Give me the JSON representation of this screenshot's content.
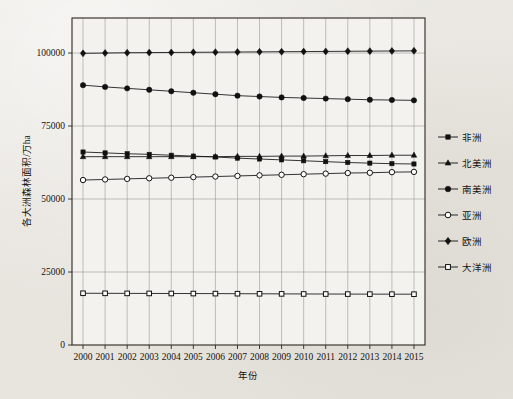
{
  "chart_data": {
    "type": "line",
    "title": "",
    "subtitle": "",
    "xlabel": "年份",
    "ylabel": "各大洲森林面积/万ha",
    "x": [
      2000,
      2001,
      2002,
      2003,
      2004,
      2005,
      2006,
      2007,
      2008,
      2009,
      2010,
      2011,
      2012,
      2013,
      2014,
      2015
    ],
    "xtick_labels": [
      "2000",
      "2001",
      "2002",
      "2003",
      "2004",
      "2005",
      "2006",
      "2007",
      "2008",
      "2009",
      "2010",
      "2011",
      "2012",
      "2013",
      "2014",
      "2015"
    ],
    "ytick_labels": [
      "0",
      "25000",
      "50000",
      "75000",
      "100000"
    ],
    "ytick_values": [
      0,
      25000,
      50000,
      75000,
      100000
    ],
    "xlim": [
      1999.5,
      2015.5
    ],
    "ylim": [
      0,
      112000
    ],
    "grid": "vertical-at-each-year-and-horizontal-at-major-ticks",
    "legend_position": "right",
    "series": [
      {
        "name": "非洲",
        "marker": "filled-square",
        "color": "#111111",
        "values": [
          66100,
          65800,
          65500,
          65300,
          65000,
          64700,
          64400,
          64000,
          63700,
          63400,
          63100,
          62800,
          62500,
          62300,
          62100,
          62000
        ]
      },
      {
        "name": "北美洲",
        "marker": "filled-triangle",
        "color": "#111111",
        "values": [
          64500,
          64500,
          64500,
          64500,
          64500,
          64500,
          64500,
          64600,
          64600,
          64700,
          64700,
          64800,
          64900,
          64900,
          65000,
          65000
        ]
      },
      {
        "name": "南美洲",
        "marker": "filled-circle",
        "color": "#111111",
        "values": [
          89000,
          88400,
          87900,
          87400,
          86900,
          86400,
          85900,
          85400,
          85100,
          84800,
          84600,
          84400,
          84200,
          84000,
          83900,
          83800
        ]
      },
      {
        "name": "亚洲",
        "marker": "open-circle",
        "color": "#111111",
        "values": [
          56500,
          56700,
          56900,
          57100,
          57300,
          57500,
          57700,
          57900,
          58100,
          58300,
          58500,
          58700,
          58900,
          59000,
          59200,
          59300
        ]
      },
      {
        "name": "欧洲",
        "marker": "filled-diamond",
        "color": "#111111",
        "values": [
          99900,
          100000,
          100100,
          100150,
          100200,
          100250,
          100300,
          100350,
          100400,
          100450,
          100500,
          100550,
          100600,
          100650,
          100700,
          100750
        ]
      },
      {
        "name": "大洋洲",
        "marker": "open-square",
        "color": "#111111",
        "values": [
          17720,
          17700,
          17680,
          17660,
          17640,
          17620,
          17600,
          17570,
          17540,
          17510,
          17480,
          17460,
          17440,
          17420,
          17410,
          17400
        ]
      }
    ]
  },
  "legend": {
    "entries": [
      {
        "label": "非洲"
      },
      {
        "label": "北美洲"
      },
      {
        "label": "南美洲"
      },
      {
        "label": "亚洲"
      },
      {
        "label": "欧洲"
      },
      {
        "label": "大洋洲"
      }
    ]
  },
  "axes": {
    "x_title": "年份",
    "y_title": "各大洲森林面积/万ha"
  },
  "colors": {
    "ink": "#15130f",
    "gridline": "#9a9890",
    "axis": "#2a2722",
    "paper": "#e9e7e2",
    "plot_background": "#f4f2ee"
  }
}
